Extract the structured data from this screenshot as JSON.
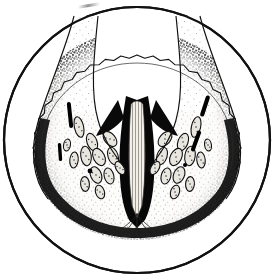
{
  "figure": {
    "domain_label": "scientific-illustration",
    "caption": "",
    "medium": "black-and-white stipple engraving",
    "background_color": "#ffffff",
    "ink_color": "#000000",
    "outline_color": "#111111",
    "midtone_color": "#555555",
    "pale_tissue_color": "#f2f0ec"
  },
  "field_of_view": {
    "shape": "circle",
    "center_x": 137,
    "center_y": 140,
    "radius": 133,
    "stroke_width": 2.2,
    "stroke_color": "#111111",
    "fill": "#ffffff"
  },
  "specimen": {
    "name": "bilobed-cross-section",
    "form": "U-shaped / V-shaped with deep median cleft opening upward",
    "left_lobe": {
      "name": "left-lobe",
      "outer_cortex_shading": "dense-stipple-dark",
      "inner_medulla_shading": "light-stipple"
    },
    "right_lobe": {
      "name": "right-lobe",
      "outer_cortex_shading": "dense-stipple-dark",
      "inner_medulla_shading": "light-stipple"
    },
    "median_cleft": {
      "name": "median-cleft",
      "description": "dark wedge-shaped fissure descending from the mid-upper field to the base",
      "fill": "#000000"
    },
    "central_column": {
      "name": "central-striated-column",
      "description": "pale vertically striated septum flanked by black fissure walls",
      "fill": "#efece6"
    },
    "basal_stalk": {
      "name": "basal-stalk",
      "description": "fan of fine striations converging at the bottom of the cleft"
    },
    "margin": {
      "name": "crenulate-margin",
      "description": "scalloped outer border with fine repeating lobules"
    }
  },
  "structures": {
    "lacunae_label": "oval lacunae",
    "lacunae_count": 26,
    "dark_slits_label": "dark elongated slits",
    "dark_slits_count": 4,
    "lacunae": [
      {
        "cx": 79,
        "cy": 127,
        "rx": 4.6,
        "ry": 10.5,
        "rot": -12
      },
      {
        "cx": 92,
        "cy": 142,
        "rx": 5.0,
        "ry": 9.0,
        "rot": -20
      },
      {
        "cx": 86,
        "cy": 156,
        "rx": 5.2,
        "ry": 9.8,
        "rot": -8
      },
      {
        "cx": 99,
        "cy": 157,
        "rx": 5.6,
        "ry": 9.2,
        "rot": -26
      },
      {
        "cx": 110,
        "cy": 139,
        "rx": 5.4,
        "ry": 8.6,
        "rot": -40
      },
      {
        "cx": 113,
        "cy": 156,
        "rx": 5.0,
        "ry": 9.0,
        "rot": -18
      },
      {
        "cx": 74,
        "cy": 160,
        "rx": 4.2,
        "ry": 8.0,
        "rot": 6
      },
      {
        "cx": 96,
        "cy": 175,
        "rx": 5.4,
        "ry": 8.6,
        "rot": -22
      },
      {
        "cx": 109,
        "cy": 176,
        "rx": 4.8,
        "ry": 8.2,
        "rot": -14
      },
      {
        "cx": 85,
        "cy": 184,
        "rx": 4.4,
        "ry": 7.4,
        "rot": -4
      },
      {
        "cx": 100,
        "cy": 192,
        "rx": 4.4,
        "ry": 7.0,
        "rot": -18
      },
      {
        "cx": 120,
        "cy": 168,
        "rx": 4.0,
        "ry": 7.2,
        "rot": -30
      },
      {
        "cx": 67,
        "cy": 145,
        "rx": 3.4,
        "ry": 6.0,
        "rot": 10
      },
      {
        "cx": 196,
        "cy": 127,
        "rx": 4.6,
        "ry": 10.5,
        "rot": 12
      },
      {
        "cx": 183,
        "cy": 142,
        "rx": 5.0,
        "ry": 9.0,
        "rot": 20
      },
      {
        "cx": 190,
        "cy": 156,
        "rx": 5.2,
        "ry": 9.8,
        "rot": 8
      },
      {
        "cx": 176,
        "cy": 157,
        "rx": 5.6,
        "ry": 9.2,
        "rot": 26
      },
      {
        "cx": 165,
        "cy": 139,
        "rx": 5.4,
        "ry": 8.6,
        "rot": 40
      },
      {
        "cx": 162,
        "cy": 156,
        "rx": 5.0,
        "ry": 9.0,
        "rot": 18
      },
      {
        "cx": 201,
        "cy": 160,
        "rx": 4.2,
        "ry": 8.0,
        "rot": -6
      },
      {
        "cx": 179,
        "cy": 175,
        "rx": 5.4,
        "ry": 8.6,
        "rot": 22
      },
      {
        "cx": 166,
        "cy": 176,
        "rx": 4.8,
        "ry": 8.2,
        "rot": 14
      },
      {
        "cx": 190,
        "cy": 184,
        "rx": 4.4,
        "ry": 7.4,
        "rot": 4
      },
      {
        "cx": 175,
        "cy": 192,
        "rx": 4.4,
        "ry": 7.0,
        "rot": 18
      },
      {
        "cx": 155,
        "cy": 168,
        "rx": 4.0,
        "ry": 7.2,
        "rot": 30
      },
      {
        "cx": 208,
        "cy": 145,
        "rx": 3.4,
        "ry": 6.0,
        "rot": -10
      }
    ],
    "dark_slits": [
      {
        "cx": 70,
        "cy": 115,
        "w": 4.0,
        "h": 26,
        "rot": -6
      },
      {
        "cx": 205,
        "cy": 106,
        "w": 4.2,
        "h": 22,
        "rot": 18
      },
      {
        "cx": 196,
        "cy": 141,
        "w": 4.0,
        "h": 22,
        "rot": 20
      },
      {
        "cx": 60,
        "cy": 152,
        "w": 3.4,
        "h": 18,
        "rot": -4
      }
    ],
    "dark_dots": [
      {
        "cx": 90,
        "cy": 171,
        "r": 2.4
      },
      {
        "cx": 185,
        "cy": 165,
        "r": 2.0
      }
    ]
  }
}
